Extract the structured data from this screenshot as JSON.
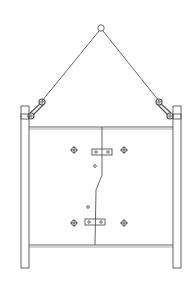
{
  "diagram": {
    "title": "Lifting frame with sling and panel",
    "colors": {
      "stroke": "#555555",
      "background": "#ffffff"
    },
    "components": {
      "lifting_ring": "Lifting ring",
      "slings": [
        "Left sling",
        "Right sling"
      ],
      "shackles": [
        "Left shackle",
        "Right shackle"
      ],
      "posts": [
        "Left post",
        "Right post"
      ],
      "panel": "Door panel",
      "hinges": [
        "Upper hinge plate",
        "Lower hinge plate"
      ],
      "bolts": [
        "Bolt",
        "Bolt",
        "Bolt",
        "Bolt"
      ]
    }
  }
}
